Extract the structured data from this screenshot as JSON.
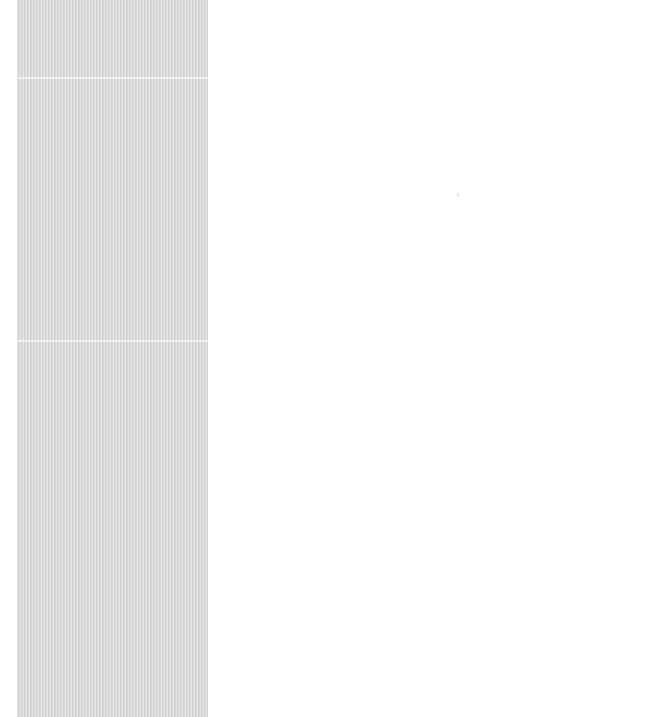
{
  "window": {
    "title": ""
  },
  "sidebar": {
    "sections": [
      {
        "label": ""
      },
      {
        "label": ""
      },
      {
        "label": ""
      }
    ]
  },
  "main": {
    "content": ""
  },
  "colors": {
    "panel_background": "#d9d9d9",
    "page_background": "#ffffff"
  }
}
